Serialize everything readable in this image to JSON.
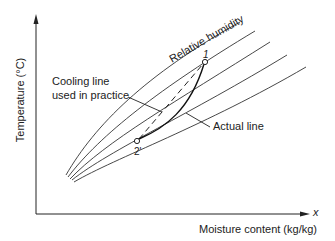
{
  "diagram": {
    "type": "psychrometric-cooling-process",
    "axes": {
      "y_label": "Temperature (°C)",
      "x_label": "Moisture content (kg/kg)",
      "x_symbol": "x"
    },
    "curves": {
      "family_label": "Relative humidity",
      "count": 5
    },
    "points": [
      {
        "id": "1",
        "label": "1"
      },
      {
        "id": "2prime",
        "label": "2'"
      }
    ],
    "annotations": {
      "cooling_line": [
        "Cooling line",
        "used in practice"
      ],
      "actual_line": "Actual line"
    },
    "colors": {
      "line": "#222222",
      "background": "#ffffff"
    }
  }
}
